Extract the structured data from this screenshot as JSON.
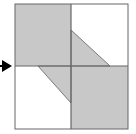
{
  "figure": {
    "name": "quadrant-shaded-square-diagram",
    "description": "Square divided into four quadrants by a horizontal and vertical midline, with shaded regions forming a pinwheel-like pattern, and a left-pointing-in arrow marker at the left midline",
    "background_color": "#ffffff",
    "fill_color": "#c8c8c8",
    "line_color": "#666666",
    "arrow_color": "#000000",
    "square": {
      "left": 15,
      "top": 4,
      "right": 128,
      "bottom": 129,
      "center_x": 71,
      "center_y": 66
    },
    "regions": [
      {
        "name": "top-left-quadrant",
        "shape": "rectangle",
        "shaded": true,
        "points": "15,4 71,4 71,66 15,66"
      },
      {
        "name": "top-right-quadrant",
        "shape": "rectangle",
        "shaded": false,
        "points": "71,4 128,4 128,66 71,66"
      },
      {
        "name": "bottom-left-quadrant",
        "shape": "rectangle",
        "shaded": false,
        "points": "15,66 71,66 71,129 15,129"
      },
      {
        "name": "bottom-right-quadrant",
        "shape": "rectangle",
        "shaded": true,
        "points": "71,66 128,66 128,129 71,129"
      },
      {
        "name": "top-right-shaded-triangle",
        "shape": "triangle",
        "shaded": true,
        "points": "71,30 110,66 71,66"
      },
      {
        "name": "bottom-left-shaded-triangle",
        "shape": "triangle",
        "shaded": true,
        "points": "38,66 71,66 71,103"
      }
    ],
    "midlines": [
      {
        "name": "horizontal-midline",
        "x1": 15,
        "y1": 66,
        "x2": 128,
        "y2": 66
      },
      {
        "name": "vertical-midline",
        "x1": 71,
        "y1": 4,
        "x2": 71,
        "y2": 129
      }
    ],
    "arrow_marker": {
      "name": "left-midline-arrow-marker",
      "direction": "right",
      "points": "2,60 12,66 2,72",
      "tail": {
        "x1": 0,
        "y1": 66,
        "x2": 4,
        "y2": 66
      }
    }
  }
}
